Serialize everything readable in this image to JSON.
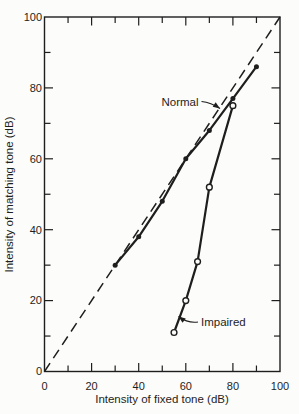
{
  "figure": {
    "paper_color": "#fcfcfa",
    "ink_color": "#1e1e1e"
  },
  "chart_data": {
    "type": "line",
    "title": "",
    "xlabel": "Intensity of fixed tone (dB)",
    "ylabel": "Intensity of matching tone (dB)",
    "xlim": [
      0,
      100
    ],
    "ylim": [
      0,
      100
    ],
    "xticks": [
      0,
      20,
      40,
      60,
      80,
      100
    ],
    "yticks": [
      0,
      20,
      40,
      60,
      80,
      100
    ],
    "minor_tick_step": 10,
    "grid": false,
    "reference_line": {
      "name": "identity-line",
      "style": "dashed",
      "from": [
        0,
        0
      ],
      "to": [
        100,
        100
      ]
    },
    "series": [
      {
        "name": "Normal",
        "marker": "filled-circle",
        "points": [
          [
            30,
            30
          ],
          [
            40,
            38
          ],
          [
            50,
            48
          ],
          [
            60,
            60
          ],
          [
            70,
            68
          ],
          [
            80,
            77
          ],
          [
            90,
            86
          ]
        ]
      },
      {
        "name": "Impaired",
        "marker": "open-circle",
        "points": [
          [
            55,
            11
          ],
          [
            60,
            20
          ],
          [
            65,
            31
          ],
          [
            70,
            52
          ],
          [
            80,
            75
          ]
        ]
      }
    ],
    "annotations": [
      {
        "id": "normal",
        "text": "Normal",
        "anchor": "end",
        "text_x": 198.5,
        "text_y": 101.5,
        "ctrl_x": 211,
        "ctrl_y": 102.5,
        "tip_x": 220,
        "tip_y": 108.5
      },
      {
        "id": "impaired",
        "text": "Impaired",
        "anchor": "start",
        "text_x": 201,
        "text_y": 322,
        "ctrl_x": 188,
        "ctrl_y": 323.5,
        "tip_x": 178.5,
        "tip_y": 316.5
      }
    ]
  }
}
